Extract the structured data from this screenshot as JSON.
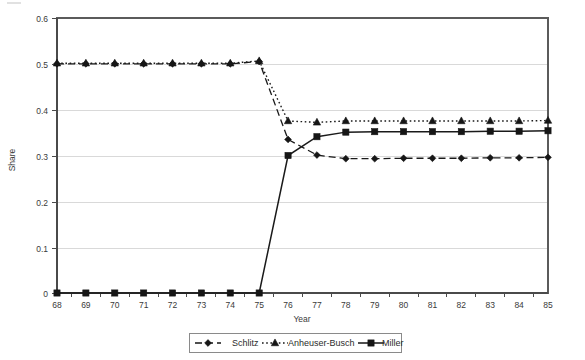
{
  "chart_data": {
    "type": "line",
    "title": "",
    "xlabel": "Year",
    "ylabel": "Share",
    "x": [
      "68",
      "69",
      "70",
      "71",
      "72",
      "73",
      "74",
      "75",
      "76",
      "77",
      "78",
      "79",
      "80",
      "81",
      "82",
      "83",
      "84",
      "85"
    ],
    "xlim": [
      68,
      85
    ],
    "ylim": [
      0,
      0.6
    ],
    "yticks": [
      "0",
      "0.1",
      "0.2",
      "0.3",
      "0.4",
      "0.5",
      "0.6"
    ],
    "ytick_values": [
      0,
      0.1,
      0.2,
      0.3,
      0.4,
      0.5,
      0.6
    ],
    "grid": "horizontal",
    "legend_position": "bottom",
    "series": [
      {
        "name": "Schlitz",
        "marker": "diamond",
        "line_style": "dashed",
        "color": "#161616",
        "values": [
          0.5,
          0.5,
          0.5,
          0.5,
          0.5,
          0.5,
          0.5,
          0.505,
          0.335,
          0.301,
          0.293,
          0.293,
          0.294,
          0.294,
          0.294,
          0.295,
          0.295,
          0.296
        ]
      },
      {
        "name": "Anheuser-Busch",
        "marker": "triangle",
        "line_style": "dotted",
        "color": "#161616",
        "values": [
          0.5,
          0.5,
          0.5,
          0.5,
          0.5,
          0.5,
          0.5,
          0.505,
          0.374,
          0.371,
          0.374,
          0.374,
          0.374,
          0.374,
          0.374,
          0.374,
          0.374,
          0.375
        ]
      },
      {
        "name": "Miller",
        "marker": "square",
        "line_style": "solid",
        "color": "#161616",
        "values": [
          0.0,
          0.0,
          0.0,
          0.0,
          0.0,
          0.0,
          0.0,
          0.0,
          0.3,
          0.341,
          0.351,
          0.352,
          0.352,
          0.352,
          0.352,
          0.353,
          0.353,
          0.354
        ]
      }
    ]
  },
  "legend": {
    "items": [
      {
        "label": "Schlitz"
      },
      {
        "label": "Anheuser-Busch"
      },
      {
        "label": "Miller"
      }
    ]
  },
  "axes": {
    "y_title": "Share",
    "x_title": "Year"
  }
}
